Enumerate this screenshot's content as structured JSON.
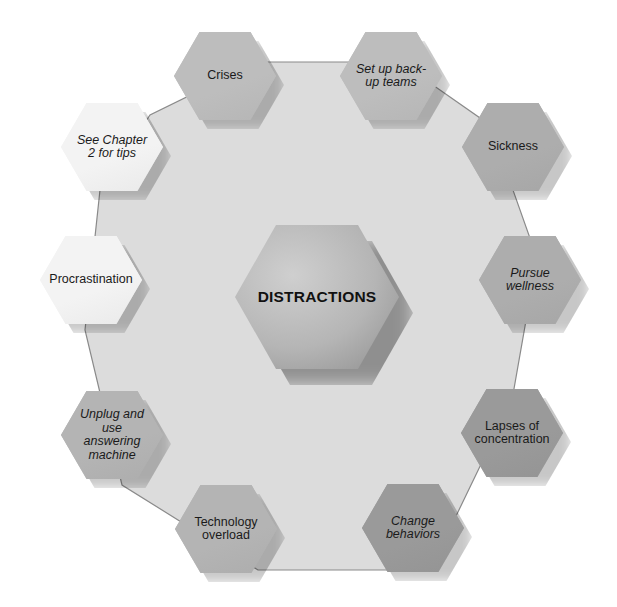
{
  "diagram": {
    "title": "DISTRACTIONS",
    "colors": {
      "background": "#ffffff",
      "decagon_fill": "#dcdcdc",
      "decagon_stroke": "#8a8a8a",
      "center_fill_light": "#cfcfcf",
      "center_fill_dark": "#8f8f8f"
    },
    "nodes": [
      {
        "id": "crises",
        "label": "Crises",
        "italic": false,
        "fill": "#bdbdbd",
        "cx": 225,
        "cy": 76
      },
      {
        "id": "set-up-back-up-teams",
        "label": "Set up back-up teams",
        "italic": true,
        "fill": "#bdbdbd",
        "cx": 391,
        "cy": 76
      },
      {
        "id": "sickness",
        "label": "Sickness",
        "italic": false,
        "fill": "#adadad",
        "cx": 513,
        "cy": 147
      },
      {
        "id": "pursue-wellness",
        "label": "Pursue wellness",
        "italic": true,
        "fill": "#adadad",
        "cx": 530,
        "cy": 280
      },
      {
        "id": "lapses-of-concentration",
        "label": "Lapses of concentration",
        "italic": false,
        "fill": "#9a9a9a",
        "cx": 512,
        "cy": 433
      },
      {
        "id": "change-behaviors",
        "label": "Change behaviors",
        "italic": true,
        "fill": "#9a9a9a",
        "cx": 413,
        "cy": 528
      },
      {
        "id": "technology-overload",
        "label": "Technology overload",
        "italic": false,
        "fill": "#b4b4b4",
        "cx": 226,
        "cy": 529
      },
      {
        "id": "unplug-and-use-answering-machine",
        "label": "Unplug and use answering machine",
        "italic": true,
        "fill": "#b4b4b4",
        "cx": 112,
        "cy": 435
      },
      {
        "id": "procrastination",
        "label": "Procrastination",
        "italic": false,
        "fill": "#f3f3f3",
        "cx": 91,
        "cy": 280
      },
      {
        "id": "see-chapter-2-for-tips",
        "label": "See Chapter 2 for tips",
        "italic": true,
        "fill": "#f3f3f3",
        "cx": 112,
        "cy": 147
      }
    ],
    "center": {
      "label": "DISTRACTIONS",
      "cx": 317,
      "cy": 297,
      "w": 164,
      "h": 144
    },
    "node_size": {
      "w": 102,
      "h": 88
    }
  }
}
